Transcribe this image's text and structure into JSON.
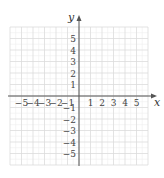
{
  "chart_data": {
    "type": "coordinate-grid",
    "title": "",
    "xlabel": "x",
    "ylabel": "y",
    "xlim": [
      -6,
      6
    ],
    "ylim": [
      -6,
      6
    ],
    "grid": true,
    "grid_minor": true,
    "x_ticks": [
      -5,
      -4,
      -3,
      -2,
      -1,
      1,
      2,
      3,
      4,
      5
    ],
    "y_ticks": [
      5,
      4,
      3,
      2,
      1,
      -1,
      -2,
      -3,
      -4,
      -5
    ],
    "x_tick_labels": [
      "−5",
      "−4",
      "−3",
      "−2",
      "−1",
      "1",
      "2",
      "3",
      "4",
      "5"
    ],
    "y_tick_labels": [
      "5",
      "4",
      "3",
      "2",
      "1",
      "−1",
      "−2",
      "−3",
      "−4",
      "−5"
    ],
    "series": []
  },
  "colors": {
    "grid_major": "#dcdcdc",
    "grid_minor": "#eeeeee",
    "axis": "#555555",
    "labels": "#444444"
  },
  "axes": {
    "x_label": "x",
    "y_label": "y"
  }
}
